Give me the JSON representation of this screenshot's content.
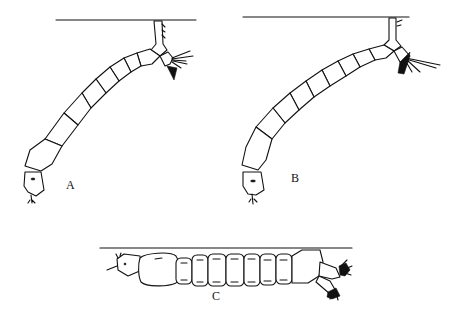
{
  "figure": {
    "panels": [
      {
        "id": "A",
        "label": "A",
        "description": "Larva hanging at an angle from the surface by its siphon"
      },
      {
        "id": "B",
        "label": "B",
        "description": "Larva hanging at an angle from the surface by its siphon (longer siphon)"
      },
      {
        "id": "C",
        "label": "C",
        "description": "Larva lying parallel just beneath the surface"
      }
    ],
    "colors": {
      "ink": "#111111",
      "background": "#ffffff"
    }
  }
}
